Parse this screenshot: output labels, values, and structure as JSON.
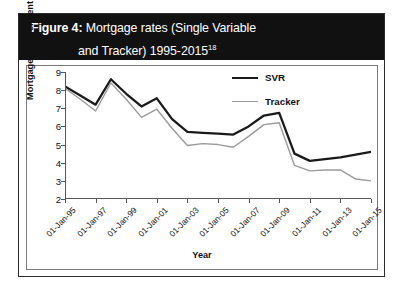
{
  "figure": {
    "label": "Figure 4:",
    "title_line1": "Mortgage rates (Single Variable",
    "title_line2": "and Tracker) 1995-2015",
    "footnote_marker": "18"
  },
  "legend": {
    "position": "top-right",
    "entries": [
      {
        "name": "svr",
        "label": "SVR",
        "color": "#1a1a1a"
      },
      {
        "name": "tracker",
        "label": "Tracker",
        "color": "#9a9a9a"
      }
    ]
  },
  "axes": {
    "ylabel": "Mortgage rate per cent",
    "xlabel": "Year",
    "yticks": [
      "9",
      "8",
      "7",
      "6",
      "5",
      "4",
      "3",
      "2"
    ],
    "xticks": [
      "01-Jan-95",
      "01-Jan-97",
      "01-Jan-99",
      "01-Jan-01",
      "01-Jan-03",
      "01-Jan-05",
      "01-Jan-07",
      "01-Jan-09",
      "01-Jan-11",
      "01-Jan-13",
      "01-Jan-15"
    ]
  },
  "chart_data": {
    "type": "line",
    "title": "Mortgage rates (Single Variable and Tracker) 1995-2015",
    "xlabel": "Year",
    "ylabel": "Mortgage rate per cent",
    "ylim": [
      2,
      9
    ],
    "grid": false,
    "legend_position": "top-right",
    "x": [
      "01-Jan-95",
      "01-Jan-96",
      "01-Jan-97",
      "01-Jan-98",
      "01-Jan-99",
      "01-Jan-00",
      "01-Jan-01",
      "01-Jan-02",
      "01-Jan-03",
      "01-Jan-04",
      "01-Jan-05",
      "01-Jan-06",
      "01-Jan-07",
      "01-Jan-08",
      "01-Jan-09",
      "01-Jan-10",
      "01-Jan-11",
      "01-Jan-12",
      "01-Jan-13",
      "01-Jan-14",
      "01-Jan-15"
    ],
    "series": [
      {
        "name": "SVR",
        "color": "#1a1a1a",
        "values": [
          8.2,
          7.7,
          7.2,
          8.6,
          7.8,
          7.1,
          7.55,
          6.4,
          5.7,
          5.65,
          5.6,
          5.55,
          6.0,
          6.6,
          6.75,
          4.5,
          4.1,
          4.2,
          4.3,
          4.45,
          4.6
        ]
      },
      {
        "name": "Tracker",
        "color": "#9a9a9a",
        "values": [
          8.1,
          7.5,
          6.85,
          8.4,
          7.5,
          6.5,
          6.95,
          5.9,
          4.95,
          5.05,
          5.0,
          4.85,
          5.45,
          6.1,
          6.2,
          3.85,
          3.55,
          3.6,
          3.6,
          3.1,
          3.0
        ]
      }
    ]
  }
}
